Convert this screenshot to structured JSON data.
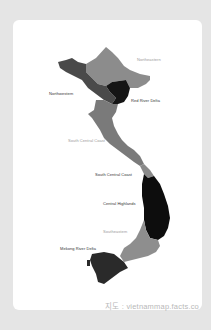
{
  "map": {
    "title": "Vietnam regions",
    "colors": {
      "background": "#e5e5e5",
      "card": "#ffffff",
      "northeastern": "#8c8c8c",
      "northwestern": "#4a4a4a",
      "red_river_delta": "#151515",
      "north_central_coast": "#7a7a7a",
      "south_central_coast": "#8a8a8a",
      "central_highlands": "#0d0d0d",
      "southeastern": "#8e8e8e",
      "mekong_river_delta": "#2a2a2a"
    },
    "labels": {
      "northeastern": "Northeastern",
      "northwestern": "Northwestern",
      "red_river_delta": "Red River Delta",
      "north_central_coast": "South Central Coast",
      "south_central_coast": "South Central Coast",
      "central_highlands": "Central Highlands",
      "southeastern": "Southeastern",
      "mekong_river_delta": "Mekong River Delta"
    },
    "credit": "지도 : vietnammap.facts.co"
  }
}
